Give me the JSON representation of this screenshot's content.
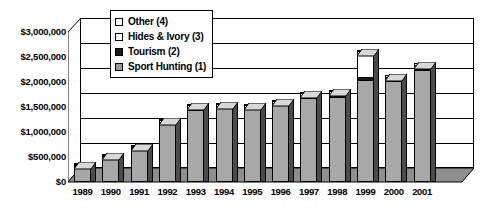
{
  "chart_data": {
    "type": "bar",
    "subtype": "stacked-column-3d",
    "title": "",
    "xlabel": "",
    "ylabel": "",
    "categories": [
      "1989",
      "1990",
      "1991",
      "1992",
      "1993",
      "1994",
      "1995",
      "1996",
      "1997",
      "1998",
      "1999",
      "2000",
      "2001"
    ],
    "ylim": [
      0,
      3000000
    ],
    "ytick_values": [
      0,
      500000,
      1000000,
      1500000,
      2000000,
      2500000,
      3000000
    ],
    "ytick_labels": [
      "$0",
      "$500,000",
      "$1,000,000",
      "$1,500,000",
      "$2,000,000",
      "$2,500,000",
      "$3,000,000"
    ],
    "grid": true,
    "legend_position": "top-left-inside",
    "series": [
      {
        "name": "Sport Hunting (1)",
        "color": "#999999",
        "values": [
          350000,
          500000,
          660000,
          1150000,
          1440000,
          1470000,
          1460000,
          1530000,
          1670000,
          1700000,
          2030000,
          2010000,
          2230000
        ]
      },
      {
        "name": "Tourism (2)",
        "color": "#1a1a1a",
        "values": [
          15000,
          20000,
          30000,
          40000,
          45000,
          40000,
          40000,
          45000,
          50000,
          55000,
          60000,
          45000,
          50000
        ]
      },
      {
        "name": "Hides & Ivory (3)",
        "color": "#ffffff",
        "values": [
          10000,
          25000,
          40000,
          50000,
          55000,
          50000,
          45000,
          50000,
          55000,
          60000,
          520000,
          50000,
          60000
        ]
      },
      {
        "name": "Other (4)",
        "color": "#ffffff",
        "values": [
          5000,
          15000,
          20000,
          25000,
          30000,
          25000,
          25000,
          25000,
          30000,
          35000,
          40000,
          30000,
          35000
        ]
      }
    ],
    "totals": [
      380000,
      560000,
      750000,
      1265000,
      1570000,
      1585000,
      1570000,
      1650000,
      1805000,
      1850000,
      2650000,
      2135000,
      2375000
    ]
  },
  "legend": {
    "items": [
      {
        "label": "Other (4)",
        "swatch": "#ffffff"
      },
      {
        "label": "Hides & Ivory (3)",
        "swatch": "#ffffff"
      },
      {
        "label": "Tourism (2)",
        "swatch": "#1a1a1a"
      },
      {
        "label": "Sport Hunting (1)",
        "swatch": "#9a9a9a"
      }
    ]
  },
  "colors": {
    "bar_front": "#a8a8a8",
    "bar_side": "#4b4b4b",
    "bar_top": "#d8d8d8",
    "floor": "#8f8f8f",
    "sidewall": "#ffffff",
    "axis": "#000000",
    "background": "#ffffff"
  }
}
